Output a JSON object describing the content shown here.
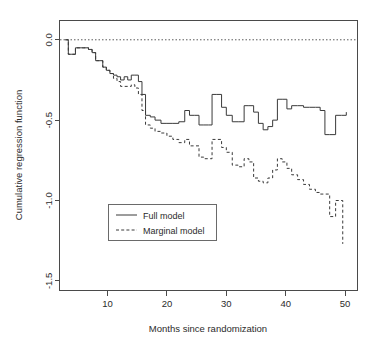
{
  "chart_data": {
    "type": "line",
    "subtype": "step",
    "title": "",
    "xlabel": "Months since randomization",
    "ylabel": "Cumulative regression function",
    "xlim": [
      2,
      52
    ],
    "ylim": [
      -1.56,
      0.12
    ],
    "xticks": [
      10,
      20,
      30,
      40,
      50
    ],
    "xticklabels": [
      "10",
      "20",
      "30",
      "40",
      "50"
    ],
    "yticks": [
      0.0,
      -0.5,
      -1.0,
      -1.5
    ],
    "yticklabels": [
      "0.0",
      "-0.5",
      "-1.0",
      "-1.5"
    ],
    "grid": false,
    "reference_line": {
      "y": 0.0,
      "style": "dotted"
    },
    "legend": {
      "position": "bottom-left",
      "entries": [
        {
          "label": "Full model",
          "style": "solid"
        },
        {
          "label": "Marginal model",
          "style": "dashed"
        }
      ]
    },
    "series": [
      {
        "name": "Full model",
        "style": "solid",
        "x": [
          2.9,
          3.4,
          4.0,
          4.6,
          5.2,
          6.0,
          6.8,
          7.4,
          8.0,
          8.6,
          9.2,
          9.8,
          10.4,
          11.0,
          11.6,
          12.2,
          12.8,
          13.4,
          14.0,
          14.6,
          15.2,
          15.8,
          16.4,
          17.2,
          18.0,
          19.0,
          20.0,
          21.0,
          22.0,
          23.0,
          23.8,
          24.6,
          25.4,
          26.2,
          27.0,
          27.6,
          28.4,
          29.2,
          30.0,
          31.0,
          32.0,
          33.0,
          33.8,
          34.6,
          35.4,
          36.2,
          37.0,
          37.8,
          38.6,
          39.4,
          40.2,
          41.0,
          42.0,
          43.0,
          44.0,
          45.0,
          45.8,
          46.6,
          47.4,
          48.4,
          49.4,
          50.2
        ],
        "y": [
          0.0,
          -0.09,
          -0.09,
          -0.05,
          -0.05,
          -0.05,
          -0.06,
          -0.08,
          -0.13,
          -0.13,
          -0.17,
          -0.19,
          -0.21,
          -0.22,
          -0.23,
          -0.25,
          -0.23,
          -0.25,
          -0.22,
          -0.22,
          -0.26,
          -0.34,
          -0.47,
          -0.48,
          -0.5,
          -0.52,
          -0.52,
          -0.52,
          -0.51,
          -0.44,
          -0.47,
          -0.47,
          -0.53,
          -0.53,
          -0.53,
          -0.34,
          -0.34,
          -0.42,
          -0.47,
          -0.51,
          -0.51,
          -0.41,
          -0.41,
          -0.45,
          -0.52,
          -0.56,
          -0.54,
          -0.5,
          -0.37,
          -0.37,
          -0.43,
          -0.41,
          -0.41,
          -0.42,
          -0.42,
          -0.42,
          -0.44,
          -0.59,
          -0.59,
          -0.47,
          -0.47,
          -0.45
        ]
      },
      {
        "name": "Marginal model",
        "style": "dashed",
        "x": [
          2.9,
          3.4,
          4.0,
          4.6,
          5.2,
          6.0,
          6.8,
          7.4,
          8.0,
          8.6,
          9.2,
          9.8,
          10.4,
          11.0,
          11.6,
          12.2,
          12.8,
          13.4,
          14.0,
          14.6,
          15.2,
          15.8,
          16.4,
          17.2,
          18.0,
          19.0,
          20.0,
          21.0,
          22.0,
          23.0,
          23.8,
          24.6,
          25.4,
          26.2,
          27.0,
          27.6,
          28.4,
          29.2,
          30.0,
          31.0,
          32.0,
          33.0,
          33.8,
          34.6,
          35.4,
          36.2,
          37.0,
          37.8,
          38.6,
          39.4,
          40.2,
          41.0,
          42.0,
          43.0,
          44.0,
          45.0,
          45.8,
          46.6,
          47.4,
          48.4,
          49.0,
          49.6
        ],
        "y": [
          0.0,
          -0.09,
          -0.09,
          -0.05,
          -0.05,
          -0.05,
          -0.06,
          -0.08,
          -0.13,
          -0.13,
          -0.17,
          -0.19,
          -0.21,
          -0.24,
          -0.26,
          -0.29,
          -0.29,
          -0.29,
          -0.28,
          -0.3,
          -0.34,
          -0.44,
          -0.53,
          -0.55,
          -0.57,
          -0.58,
          -0.6,
          -0.62,
          -0.64,
          -0.62,
          -0.66,
          -0.66,
          -0.73,
          -0.74,
          -0.74,
          -0.62,
          -0.62,
          -0.67,
          -0.7,
          -0.78,
          -0.79,
          -0.74,
          -0.76,
          -0.86,
          -0.88,
          -0.89,
          -0.86,
          -0.81,
          -0.74,
          -0.76,
          -0.8,
          -0.84,
          -0.87,
          -0.9,
          -0.93,
          -0.95,
          -0.96,
          -0.96,
          -1.1,
          -1.0,
          -1.0,
          -1.27
        ]
      }
    ]
  },
  "axes": {
    "x_title": "Months since randomization",
    "y_title": "Cumulative regression function"
  }
}
